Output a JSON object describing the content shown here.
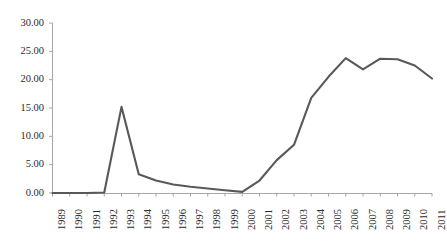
{
  "chart_data": {
    "type": "line",
    "title": "",
    "subtitle": "",
    "xlabel": "",
    "ylabel": "",
    "categories": [
      "1989",
      "1990",
      "1991",
      "1992",
      "1993",
      "1994",
      "1995",
      "1996",
      "1997",
      "1998",
      "1999",
      "2000",
      "2001",
      "2002",
      "2003",
      "2004",
      "2005",
      "2006",
      "2007",
      "2008",
      "2009",
      "2010",
      "2011"
    ],
    "values": [
      0.0,
      0.0,
      0.0,
      0.1,
      15.2,
      3.3,
      2.2,
      1.5,
      1.1,
      0.8,
      0.5,
      0.2,
      2.2,
      5.8,
      8.5,
      16.8,
      20.5,
      23.8,
      21.8,
      23.7,
      23.6,
      22.5,
      20.2
    ],
    "series": [
      {
        "name": "series-1",
        "color": "#595959",
        "values": [
          0.0,
          0.0,
          0.0,
          0.1,
          15.2,
          3.3,
          2.2,
          1.5,
          1.1,
          0.8,
          0.5,
          0.2,
          2.2,
          5.8,
          8.5,
          16.8,
          20.5,
          23.8,
          21.8,
          23.7,
          23.6,
          22.5,
          20.2
        ]
      }
    ],
    "ylim": [
      0,
      30
    ],
    "xlim": [
      "1989",
      "2011"
    ],
    "ytick_values": [
      0,
      5,
      10,
      15,
      20,
      25,
      30
    ],
    "ytick_labels": [
      "0.00",
      "5.00",
      "10.00",
      "15.00",
      "20.00",
      "25.00",
      "30.00"
    ],
    "xtick_labels": [
      "1989",
      "1990",
      "1991",
      "1992",
      "1993",
      "1994",
      "1995",
      "1996",
      "1997",
      "1998",
      "1999",
      "2000",
      "2001",
      "2002",
      "2003",
      "2004",
      "2005",
      "2006",
      "2007",
      "2008",
      "2009",
      "2010",
      "2011"
    ],
    "grid": false,
    "legend": false,
    "legend_position": "none",
    "annotations": []
  },
  "style": {
    "line_color": "#595959",
    "axis_color": "#a6a6a6",
    "tick_text_color": "#2b2b2b",
    "background": "#ffffff"
  }
}
